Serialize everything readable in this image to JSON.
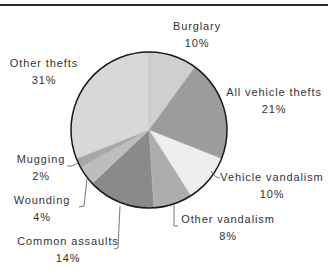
{
  "chart_data": {
    "type": "pie",
    "title": "",
    "start_angle_deg": 0,
    "direction": "clockwise",
    "slices": [
      {
        "label": "Burglary",
        "value": 10,
        "pct_label": "10%",
        "color": "#cfcfcf"
      },
      {
        "label": "All vehicle thefts",
        "value": 21,
        "pct_label": "21%",
        "color": "#9c9c9c"
      },
      {
        "label": "Vehicle vandalism",
        "value": 10,
        "pct_label": "10%",
        "color": "#eeeeee"
      },
      {
        "label": "Other vandalism",
        "value": 8,
        "pct_label": "8%",
        "color": "#adadad"
      },
      {
        "label": "Common assaults",
        "value": 14,
        "pct_label": "14%",
        "color": "#8a8a8a"
      },
      {
        "label": "Wounding",
        "value": 4,
        "pct_label": "4%",
        "color": "#bdbdbd"
      },
      {
        "label": "Mugging",
        "value": 2,
        "pct_label": "2%",
        "color": "#a8a8a8"
      },
      {
        "label": "Other thefts",
        "value": 31,
        "pct_label": "31%",
        "color": "#d8d8d8"
      }
    ],
    "legend": "none (direct labels with leader lines)"
  },
  "labels": {
    "burglary": {
      "name": "Burglary",
      "pct": "10%"
    },
    "all_vehicle_thefts": {
      "name": "All vehicle thefts",
      "pct": "21%"
    },
    "vehicle_vandalism": {
      "name": "Vehicle vandalism",
      "pct": "10%"
    },
    "other_vandalism": {
      "name": "Other vandalism",
      "pct": "8%"
    },
    "common_assaults": {
      "name": "Common assaults",
      "pct": "14%"
    },
    "wounding": {
      "name": "Wounding",
      "pct": "4%"
    },
    "mugging": {
      "name": "Mugging",
      "pct": "2%"
    },
    "other_thefts": {
      "name": "Other thefts",
      "pct": "31%"
    }
  }
}
